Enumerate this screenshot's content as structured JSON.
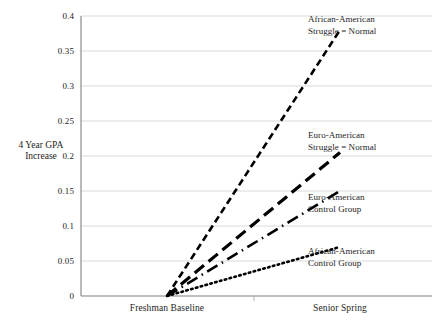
{
  "chart_data": {
    "type": "line",
    "title": "",
    "xlabel": "",
    "ylabel": "4 Year GPA Increase",
    "categories": [
      "Freshman Baseline",
      "Senior Spring"
    ],
    "x": [
      0,
      1
    ],
    "ylim": [
      0,
      0.4
    ],
    "ytick_values": [
      0,
      0.05,
      0.1,
      0.15,
      0.2,
      0.25,
      0.3,
      0.35,
      0.4
    ],
    "ytick_labels": [
      "0",
      "0.05",
      "0.1",
      "0.15",
      "0.2",
      "0.25",
      "0.3",
      "0.35",
      "0.4"
    ],
    "grid": "horizontal",
    "legend": "inline-right-labels",
    "series": [
      {
        "name": "African-American Struggle = Normal",
        "label_line1": "African-American",
        "label_line2": "Struggle = Normal",
        "values": [
          0,
          0.38
        ],
        "style": "short-dash",
        "dasharray": "7,4",
        "width": 2.6,
        "color": "#000000"
      },
      {
        "name": "Euro-American Struggle = Normal",
        "label_line1": "Euro-American",
        "label_line2": "Struggle = Normal",
        "values": [
          0,
          0.205
        ],
        "style": "long-dash",
        "dasharray": "12,6",
        "width": 3.2,
        "color": "#000000"
      },
      {
        "name": "Euro-American Control Group",
        "label_line1": "Euro-American",
        "label_line2": "Control Group",
        "values": [
          0,
          0.15
        ],
        "style": "dash-dot",
        "dasharray": "12,5,1.5,5",
        "width": 2.6,
        "color": "#000000"
      },
      {
        "name": "African-American Control Group",
        "label_line1": "African-American",
        "label_line2": "Control Group",
        "values": [
          0,
          0.07
        ],
        "style": "dotted",
        "dasharray": "1.6,3.4",
        "width": 2.6,
        "color": "#000000"
      }
    ],
    "axis_color": "#7f7f7f",
    "grid_color": "#d9d9d9",
    "background": "#ffffff"
  },
  "ytick_positions": {
    "0.4": 16,
    "0.35": 51,
    "0.3": 86,
    "0.25": 121,
    "0.2": 156,
    "0.15": 191,
    "0.1": 226,
    "0.05": 261,
    "0": 296
  },
  "series_label_positions": [
    {
      "left": 308,
      "top": 14
    },
    {
      "left": 308,
      "top": 130
    },
    {
      "left": 308,
      "top": 192
    },
    {
      "left": 308,
      "top": 246
    }
  ],
  "xtick_positions": [
    167,
    340
  ]
}
